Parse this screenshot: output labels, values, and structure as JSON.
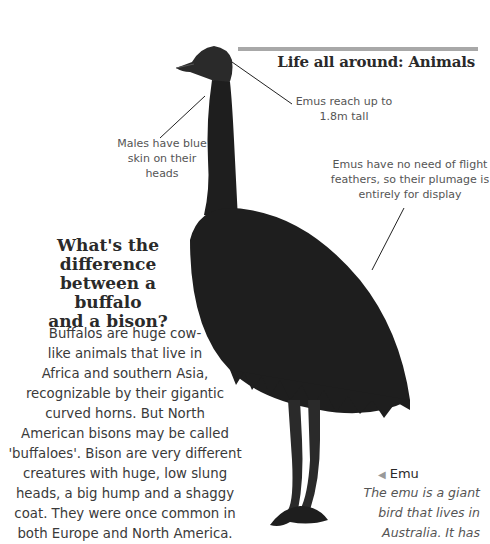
{
  "header": {
    "title": "Life all around: Animals"
  },
  "annotations": [
    {
      "id": "height",
      "text": "Emus reach up to 1.8m tall",
      "lines": [
        "Emus reach up to",
        "1.8m tall"
      ]
    },
    {
      "id": "blue-skin",
      "text": "Males have blue skin on their heads",
      "lines": [
        "Males have blue",
        "skin on their",
        "heads"
      ]
    },
    {
      "id": "plumage",
      "text": "Emus have no need of flight feathers, so their plumage is entirely for display",
      "lines": [
        "Emus have no need of flight",
        "feathers, so their plumage is",
        "entirely for display"
      ]
    }
  ],
  "question": {
    "title_lines": [
      "What's the",
      "difference",
      "between a buffalo",
      "and a bison?"
    ],
    "body_lines": [
      "Buffalos are huge cow-",
      "like animals that live in",
      "Africa and southern Asia,",
      "recognizable by their gigantic",
      "curved horns. But North",
      "American bisons may be called",
      "'buffaloes'. Bison are very different",
      "creatures with huge, low slung",
      "heads, a big hump and a shaggy",
      "coat. They were once common in",
      "both Europe and North America."
    ]
  },
  "caption": {
    "pointer_icon": "left-triangle",
    "title": "Emu",
    "body_lines": [
      "The emu is a giant",
      "bird that lives in",
      "Australia. It has"
    ]
  },
  "colors": {
    "rule": "#a8a8a8",
    "text": "#3a3a3a",
    "emu": "#1e1e1e"
  }
}
